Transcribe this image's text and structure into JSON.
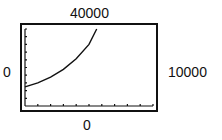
{
  "labels": {
    "ymax": "40000",
    "xmin": "0",
    "xmax": "10000",
    "ymin": "0"
  },
  "chart_data": {
    "type": "line",
    "title": "",
    "xlabel": "",
    "ylabel": "",
    "xlim": [
      0,
      10000
    ],
    "ylim": [
      0,
      40000
    ],
    "grid": false,
    "axes_visible": true,
    "x_tick_count": 10,
    "y_tick_count": 10,
    "series": [
      {
        "name": "curve",
        "x": [
          0,
          1000,
          2000,
          3000,
          4000,
          5000,
          5600
        ],
        "y": [
          10000,
          12000,
          15000,
          19000,
          24500,
          32000,
          40000
        ]
      }
    ]
  }
}
